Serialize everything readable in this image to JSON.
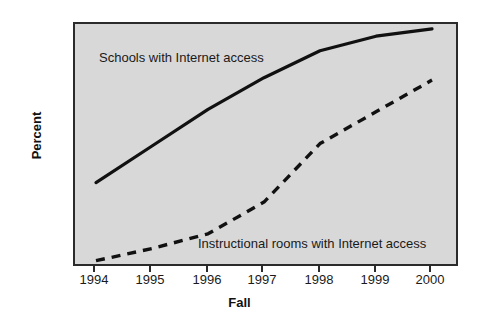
{
  "chart_data": {
    "type": "line",
    "title": "",
    "xlabel": "Fall",
    "ylabel": "Percent",
    "x": [
      1994,
      1995,
      1996,
      1997,
      1998,
      1999,
      2000
    ],
    "xticklabels": [
      "1994",
      "1995",
      "1996",
      "1997",
      "1998",
      "1999",
      "2000"
    ],
    "yticklabels": [
      "0",
      "10",
      "20",
      "30",
      "40",
      "50",
      "60",
      "70",
      "80",
      "90",
      "100"
    ],
    "ylim": [
      0,
      100
    ],
    "ytick_step": 10,
    "grid": false,
    "legend": "in-plot annotations",
    "plot_background": "#d8d8d8",
    "line_color": "#111111",
    "series": [
      {
        "name": "Schools with Internet access",
        "style": "solid",
        "values": [
          35,
          50,
          65,
          78,
          89,
          95,
          98
        ]
      },
      {
        "name": "Instructional rooms with Internet access",
        "style": "dashed",
        "values": [
          3,
          8,
          14,
          27,
          51,
          64,
          77
        ]
      }
    ],
    "annotations": [
      {
        "text": "Schools with Internet access",
        "x": 1994.3,
        "y": 86
      },
      {
        "text": "Instructional rooms with Internet access",
        "x": 1995.8,
        "y": 10
      }
    ]
  },
  "axes": {
    "y_title": "Percent",
    "x_title": "Fall",
    "yticks": [
      "100",
      "90",
      "80",
      "70",
      "60",
      "50",
      "40",
      "30",
      "20",
      "10",
      "0"
    ],
    "xticks": [
      "1994",
      "1995",
      "1996",
      "1997",
      "1998",
      "1999",
      "2000"
    ]
  },
  "labels": {
    "schools": "Schools with Internet access",
    "rooms": "Instructional rooms with Internet access"
  }
}
